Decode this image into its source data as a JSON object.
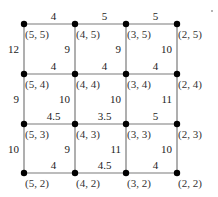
{
  "diagram": {
    "type": "grid-graph",
    "nodes": [
      {
        "id": "5,5",
        "label": "(5, 5)",
        "col": 0,
        "row": 0
      },
      {
        "id": "4,5",
        "label": "(4, 5)",
        "col": 1,
        "row": 0
      },
      {
        "id": "3,5",
        "label": "(3, 5)",
        "col": 2,
        "row": 0
      },
      {
        "id": "2,5",
        "label": "(2, 5)",
        "col": 3,
        "row": 0
      },
      {
        "id": "5,4",
        "label": "(5, 4)",
        "col": 0,
        "row": 1
      },
      {
        "id": "4,4",
        "label": "(4, 4)",
        "col": 1,
        "row": 1
      },
      {
        "id": "3,4",
        "label": "(3, 4)",
        "col": 2,
        "row": 1
      },
      {
        "id": "2,4",
        "label": "(2, 4)",
        "col": 3,
        "row": 1
      },
      {
        "id": "5,3",
        "label": "(5, 3)",
        "col": 0,
        "row": 2
      },
      {
        "id": "4,3",
        "label": "(4, 3)",
        "col": 1,
        "row": 2
      },
      {
        "id": "3,3",
        "label": "(3, 3)",
        "col": 2,
        "row": 2
      },
      {
        "id": "2,3",
        "label": "(2, 3)",
        "col": 3,
        "row": 2
      },
      {
        "id": "5,2",
        "label": "(5, 2)",
        "col": 0,
        "row": 3
      },
      {
        "id": "4,2",
        "label": "(4, 2)",
        "col": 1,
        "row": 3
      },
      {
        "id": "3,2",
        "label": "(3, 2)",
        "col": 2,
        "row": 3
      },
      {
        "id": "2,2",
        "label": "(2, 2)",
        "col": 3,
        "row": 3
      }
    ],
    "horizontal_edges": [
      {
        "from": "5,5",
        "to": "4,5",
        "weight": "4"
      },
      {
        "from": "4,5",
        "to": "3,5",
        "weight": "5"
      },
      {
        "from": "3,5",
        "to": "2,5",
        "weight": "5"
      },
      {
        "from": "5,4",
        "to": "4,4",
        "weight": "4"
      },
      {
        "from": "4,4",
        "to": "3,4",
        "weight": "4"
      },
      {
        "from": "3,4",
        "to": "2,4",
        "weight": "4"
      },
      {
        "from": "5,3",
        "to": "4,3",
        "weight": "4.5"
      },
      {
        "from": "4,3",
        "to": "3,3",
        "weight": "3.5"
      },
      {
        "from": "3,3",
        "to": "2,3",
        "weight": "5"
      },
      {
        "from": "5,2",
        "to": "4,2",
        "weight": "4"
      },
      {
        "from": "4,2",
        "to": "3,2",
        "weight": "4.5"
      },
      {
        "from": "3,2",
        "to": "2,2",
        "weight": "4"
      }
    ],
    "vertical_edges": [
      {
        "from": "5,5",
        "to": "5,4",
        "weight": "12",
        "side": "left"
      },
      {
        "from": "4,5",
        "to": "4,4",
        "weight": "9",
        "side": "left"
      },
      {
        "from": "3,5",
        "to": "3,4",
        "weight": "9",
        "side": "left"
      },
      {
        "from": "2,5",
        "to": "2,4",
        "weight": "10",
        "side": "left"
      },
      {
        "from": "5,4",
        "to": "5,3",
        "weight": "9",
        "side": "left"
      },
      {
        "from": "4,4",
        "to": "4,3",
        "weight": "10",
        "side": "left"
      },
      {
        "from": "3,4",
        "to": "3,3",
        "weight": "10",
        "side": "left"
      },
      {
        "from": "2,4",
        "to": "2,3",
        "weight": "11",
        "side": "left"
      },
      {
        "from": "5,3",
        "to": "5,2",
        "weight": "10",
        "side": "left"
      },
      {
        "from": "4,3",
        "to": "4,2",
        "weight": "9",
        "side": "left"
      },
      {
        "from": "3,3",
        "to": "3,2",
        "weight": "11",
        "side": "left"
      },
      {
        "from": "2,3",
        "to": "2,2",
        "weight": "10",
        "side": "left"
      }
    ]
  }
}
